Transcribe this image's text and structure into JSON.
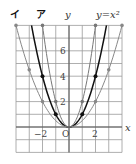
{
  "chart_data": {
    "type": "line",
    "title": "",
    "xlabel": "x",
    "ylabel": "y",
    "xlim": [
      -4,
      4
    ],
    "ylim": [
      -2,
      8
    ],
    "grid": true,
    "x_ticks_labeled": [
      "-2",
      "2"
    ],
    "y_ticks_labeled": [
      "2",
      "4",
      "6"
    ],
    "origin_label": "O",
    "series": [
      {
        "name": "y = x²",
        "label": "y=x²",
        "formula": "y = x^2",
        "color": "#111111",
        "bold": true,
        "points": [
          [
            -2,
            4
          ],
          [
            -1,
            1
          ],
          [
            1,
            1
          ],
          [
            2,
            4
          ]
        ]
      },
      {
        "name": "ア",
        "label": "ア",
        "formula": "y = 2x^2",
        "color": "#777777",
        "bold": false,
        "points": [
          [
            -2,
            8
          ],
          [
            -1,
            2
          ],
          [
            1,
            2
          ],
          [
            2,
            8
          ]
        ]
      },
      {
        "name": "イ",
        "label": "イ",
        "formula": "y = 0.5x^2",
        "color": "#888888",
        "bold": false,
        "points": [
          [
            -4,
            8
          ],
          [
            -3,
            4.5
          ],
          [
            -2,
            2
          ],
          [
            2,
            2
          ],
          [
            3,
            4.5
          ],
          [
            4,
            8
          ]
        ]
      }
    ]
  },
  "labels": {
    "y_axis": "y",
    "x_axis": "x",
    "origin": "O",
    "curve_a": "ア",
    "curve_i": "イ",
    "curve_main": "y=x²",
    "tick_neg2": "−2",
    "tick_2": "2",
    "ytick_2": "2",
    "ytick_4": "4",
    "ytick_6": "6"
  }
}
